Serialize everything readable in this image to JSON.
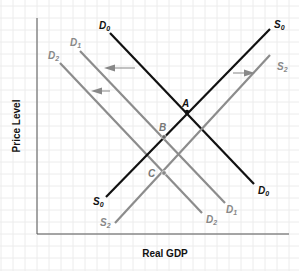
{
  "colors": {
    "black": "#111111",
    "gray": "#8c8c8c",
    "grid": "#e8e8e8",
    "axis": "#555555"
  },
  "axes": {
    "ylabel": "Price Level",
    "xlabel": "Real GDP"
  },
  "curves": {
    "D0": {
      "main": "D",
      "sub": "0"
    },
    "D1": {
      "main": "D",
      "sub": "1"
    },
    "D2": {
      "main": "D",
      "sub": "2"
    },
    "S0": {
      "main": "S",
      "sub": "0"
    },
    "S2": {
      "main": "S",
      "sub": "2"
    }
  },
  "points": {
    "A": "A",
    "B": "B",
    "C": "C"
  }
}
